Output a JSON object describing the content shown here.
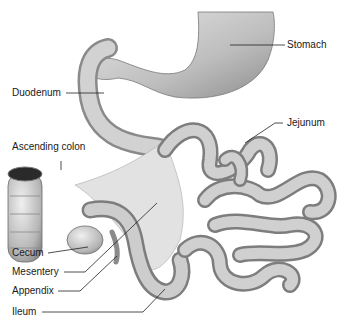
{
  "diagram": {
    "labels": [
      {
        "id": "stomach",
        "text": "Stomach"
      },
      {
        "id": "duodenum",
        "text": "Duodenum"
      },
      {
        "id": "jejunum",
        "text": "Jejunum"
      },
      {
        "id": "ascending-colon",
        "text": "Ascending colon"
      },
      {
        "id": "cecum",
        "text": "Cecum"
      },
      {
        "id": "mesentery",
        "text": "Mesentery"
      },
      {
        "id": "appendix",
        "text": "Appendix"
      },
      {
        "id": "ileum",
        "text": "Ileum"
      }
    ],
    "colors": {
      "organ_fill": "#cfcfcf",
      "organ_shade": "#9a9a9a",
      "organ_outline": "#6b6b6b",
      "mesentery_fill": "#e4e4e4",
      "leader_line": "#222222",
      "background": "#ffffff"
    }
  }
}
